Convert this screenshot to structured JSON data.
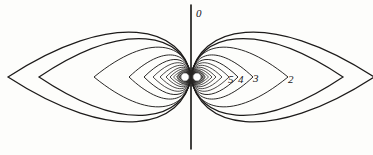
{
  "figure": {
    "background_color": "#fdfdfb",
    "line_color": "#1d1b1a",
    "axis_label": "0"
  },
  "labels": {
    "axis_zero": "0",
    "contour_2": "2",
    "contour_3": "3",
    "contour_4": "4",
    "contour_5": "5"
  },
  "chart_data": {
    "type": "line",
    "xlabel": "",
    "ylabel": "",
    "grid": false,
    "legend_position": "none",
    "annotations": [
      {
        "text": "0",
        "x": 196,
        "y": 14,
        "meaning": "axis-contour-index"
      },
      {
        "text": "5",
        "x": 228,
        "y": 80,
        "meaning": "contour-index"
      },
      {
        "text": "4",
        "x": 238,
        "y": 80,
        "meaning": "contour-index"
      },
      {
        "text": "3",
        "x": 253,
        "y": 79,
        "meaning": "contour-index"
      },
      {
        "text": "2",
        "x": 288,
        "y": 80,
        "meaning": "contour-index"
      }
    ],
    "center": {
      "x": 191,
      "y": 77
    },
    "poles": [
      {
        "x": 185,
        "y": 77,
        "r": 4.2
      },
      {
        "x": 197,
        "y": 77,
        "r": 4.2
      }
    ],
    "axis_line": {
      "x": 191,
      "y_top": 5,
      "y_bottom": 149
    },
    "series": [
      {
        "name": "lobe-0",
        "contour_index": 0,
        "half_width": 183,
        "half_height": 69
      },
      {
        "name": "lobe-1",
        "contour_index": 1,
        "half_width": 152,
        "half_height": 59
      },
      {
        "name": "lobe-2",
        "contour_index": 2,
        "half_width": 97,
        "half_height": 46
      },
      {
        "name": "lobe-3",
        "contour_index": 3,
        "half_width": 62,
        "half_height": 34
      },
      {
        "name": "lobe-4",
        "contour_index": 4,
        "half_width": 47,
        "half_height": 27
      },
      {
        "name": "lobe-5",
        "contour_index": 5,
        "half_width": 38,
        "half_height": 22
      },
      {
        "name": "lobe-6",
        "contour_index": 6,
        "half_width": 31,
        "half_height": 18
      },
      {
        "name": "lobe-7",
        "contour_index": 7,
        "half_width": 25,
        "half_height": 15
      },
      {
        "name": "lobe-8",
        "contour_index": 8,
        "half_width": 21,
        "half_height": 12.5
      },
      {
        "name": "lobe-9",
        "contour_index": 9,
        "half_width": 17.5,
        "half_height": 10.5
      },
      {
        "name": "lobe-10",
        "contour_index": 10,
        "half_width": 14.5,
        "half_height": 8.8
      },
      {
        "name": "lobe-11",
        "contour_index": 11,
        "half_width": 12,
        "half_height": 7.3
      },
      {
        "name": "lobe-12",
        "contour_index": 12,
        "half_width": 10,
        "half_height": 6.1
      },
      {
        "name": "lobe-13",
        "contour_index": 13,
        "half_width": 8.3,
        "half_height": 5.1
      },
      {
        "name": "lobe-14",
        "contour_index": 14,
        "half_width": 6.9,
        "half_height": 4.2
      },
      {
        "name": "lobe-15",
        "contour_index": 15,
        "half_width": 5.7,
        "half_height": 3.5
      }
    ],
    "symmetry": "mirrored left/right and top/bottom about center"
  }
}
